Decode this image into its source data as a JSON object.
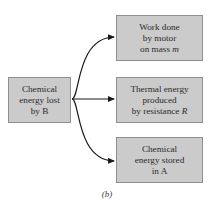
{
  "diagram": {
    "type": "flow",
    "caption": "(b)",
    "source": {
      "lines": [
        "Chemical",
        "energy lost",
        "by B"
      ]
    },
    "targets": [
      {
        "lines": [
          "Work done",
          "by motor",
          "on mass "
        ],
        "italic_suffix": "m"
      },
      {
        "lines": [
          "Thermal energy",
          "produced",
          "by resistance "
        ],
        "italic_suffix": "R"
      },
      {
        "lines": [
          "Chemical",
          "energy stored",
          "in A"
        ],
        "italic_suffix": ""
      }
    ],
    "edges": [
      {
        "from": "source",
        "to": "targets.0"
      },
      {
        "from": "source",
        "to": "targets.1"
      },
      {
        "from": "source",
        "to": "targets.2"
      }
    ],
    "colors": {
      "box_fill": "#cbcbcb",
      "box_border": "#8e8e8e",
      "arrow": "#1a1a1a",
      "text": "#2a2a2a"
    }
  }
}
